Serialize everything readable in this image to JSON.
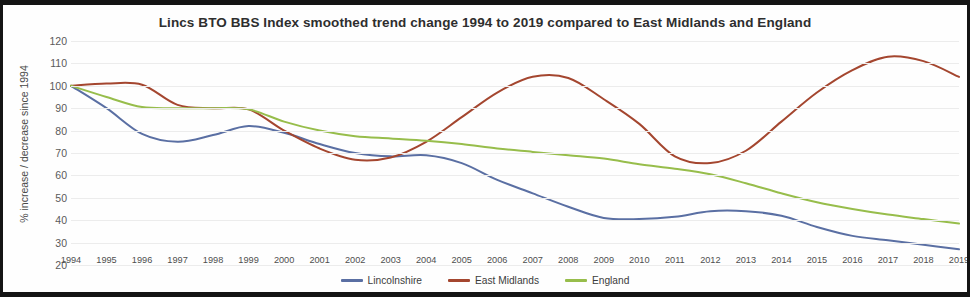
{
  "chart_data": {
    "type": "line",
    "title": "Lincs BTO BBS Index smoothed trend change 1994 to 2019 compared to East Midlands and England",
    "xlabel": "",
    "ylabel": "% increase / decrease since 1994",
    "ylim": [
      20,
      120
    ],
    "ytick_step": 10,
    "grid": true,
    "legend_position": "bottom-center",
    "x": [
      1994,
      1995,
      1996,
      1997,
      1998,
      1999,
      2000,
      2001,
      2002,
      2003,
      2004,
      2005,
      2006,
      2007,
      2008,
      2009,
      2010,
      2011,
      2012,
      2013,
      2014,
      2015,
      2016,
      2017,
      2018,
      2019
    ],
    "categories": [
      "1994",
      "1995",
      "1996",
      "1997",
      "1998",
      "1999",
      "2000",
      "2001",
      "2002",
      "2003",
      "2004",
      "2005",
      "2006",
      "2007",
      "2008",
      "2009",
      "2010",
      "2011",
      "2012",
      "2013",
      "2014",
      "2015",
      "2016",
      "2017",
      "2018",
      "2019"
    ],
    "yticks": [
      120,
      110,
      100,
      90,
      80,
      70,
      60,
      50,
      40,
      30,
      20
    ],
    "series": [
      {
        "name": "Lincolnshire",
        "color": "#5a6fa3",
        "values": [
          100,
          90,
          78.5,
          75,
          78,
          82,
          79,
          74,
          70,
          68.5,
          69,
          65.5,
          58,
          52,
          46,
          41,
          40.5,
          41.5,
          44,
          44,
          42,
          37,
          33,
          31,
          29,
          27
        ]
      },
      {
        "name": "East Midlands",
        "color": "#a4462f",
        "values": [
          100,
          101,
          100.5,
          91.5,
          90,
          89.5,
          80,
          72,
          67,
          68,
          75,
          86,
          97,
          104,
          103.5,
          94,
          83,
          68.5,
          65.5,
          71,
          84,
          97,
          107,
          113,
          111,
          104
        ]
      },
      {
        "name": "England",
        "color": "#97bd4b"
      }
    ]
  },
  "chart_series_england_values": [
    100,
    95,
    90.5,
    90,
    90,
    89.5,
    84,
    80,
    77.5,
    76.5,
    75.5,
    74,
    72,
    70.5,
    69,
    67.5,
    65,
    63,
    60.5,
    56.5,
    52,
    48,
    45,
    42.5,
    40.5,
    38.5
  ],
  "legend": {
    "items": [
      {
        "label": "Lincolnshire",
        "color": "#5a6fa3"
      },
      {
        "label": "East Midlands",
        "color": "#a4462f"
      },
      {
        "label": "England",
        "color": "#97bd4b"
      }
    ]
  }
}
